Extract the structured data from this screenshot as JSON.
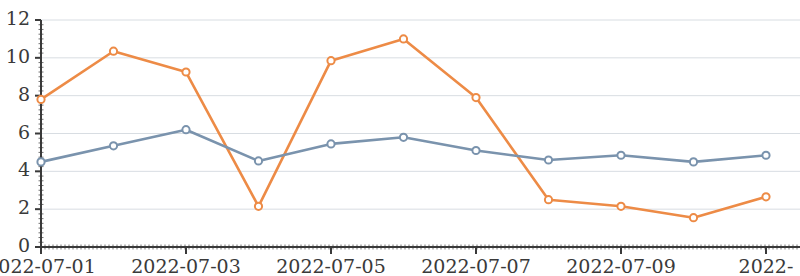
{
  "chart_data": {
    "type": "line",
    "title": "",
    "subtitle": "",
    "xlabel": "",
    "ylabel": "",
    "grid": true,
    "legend": "none",
    "x": [
      "2022-07-01",
      "2022-07-02",
      "2022-07-03",
      "2022-07-04",
      "2022-07-05",
      "2022-07-06",
      "2022-07-07",
      "2022-07-08",
      "2022-07-09",
      "2022-07-10",
      "2022-07-11"
    ],
    "xlim": [
      "2022-07-01",
      "2022-07-11"
    ],
    "ylim": [
      0,
      12
    ],
    "xtick_labels": [
      "2022-07-01",
      "2022-07-03",
      "2022-07-05",
      "2022-07-07",
      "2022-07-09",
      "2022-"
    ],
    "ytick_labels": [
      "0",
      "2",
      "4",
      "6",
      "8",
      "10",
      "12"
    ],
    "yticks": [
      0,
      2,
      4,
      6,
      8,
      10,
      12
    ],
    "series": [
      {
        "name": "series-1",
        "color": "#ed8b46",
        "marker": "open-circle",
        "values": [
          7.8,
          10.35,
          9.25,
          2.15,
          9.85,
          11.0,
          7.9,
          2.5,
          2.15,
          1.55,
          2.65
        ]
      },
      {
        "name": "series-2",
        "color": "#7a93ad",
        "marker": "open-circle",
        "values": [
          4.5,
          5.35,
          6.2,
          4.55,
          5.45,
          5.8,
          5.1,
          4.6,
          4.85,
          4.5,
          4.85
        ]
      }
    ],
    "axis_color": "#3a3a3a",
    "grid_color": "#d8dde2"
  }
}
